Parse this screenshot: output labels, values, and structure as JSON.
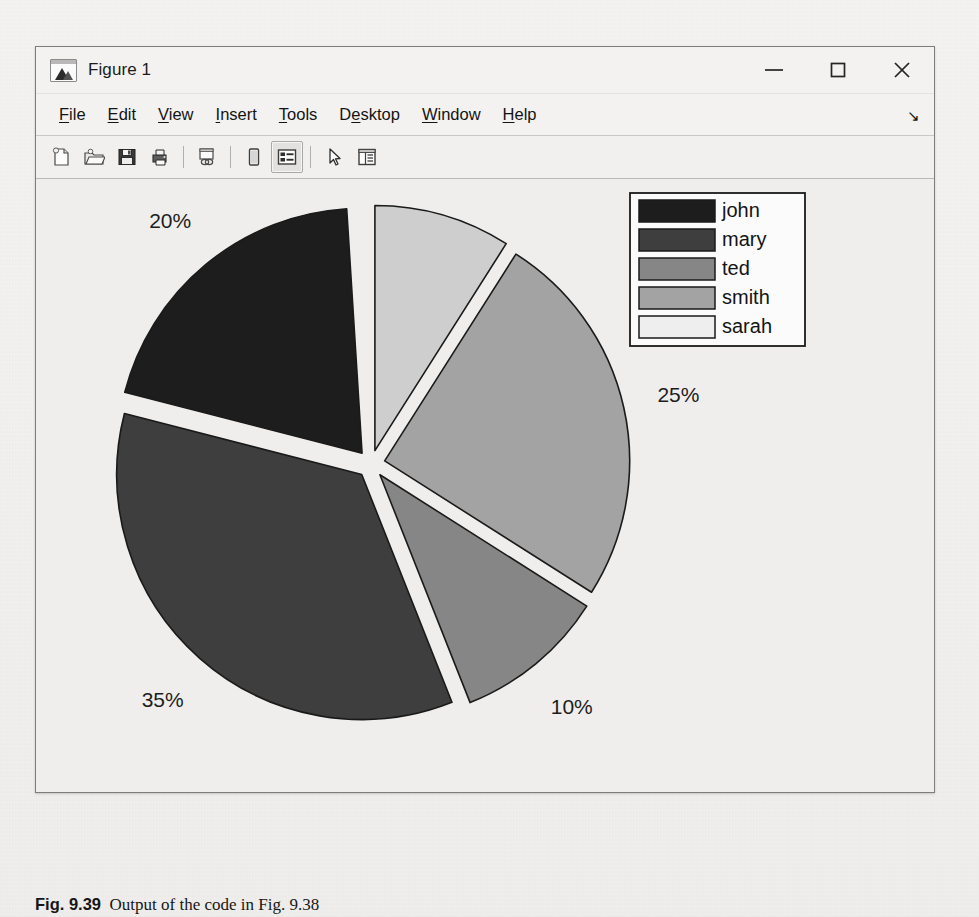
{
  "window": {
    "title": "Figure 1",
    "app_icon": "matlab-figure-icon",
    "controls": [
      {
        "name": "minimize",
        "glyph": "minimize-icon"
      },
      {
        "name": "maximize",
        "glyph": "maximize-icon"
      },
      {
        "name": "close",
        "glyph": "close-icon"
      }
    ]
  },
  "menu": {
    "items": [
      {
        "label": "File",
        "accel": "F"
      },
      {
        "label": "Edit",
        "accel": "E"
      },
      {
        "label": "View",
        "accel": "V"
      },
      {
        "label": "Insert",
        "accel": "I"
      },
      {
        "label": "Tools",
        "accel": "T"
      },
      {
        "label": "Desktop",
        "accel": "D"
      },
      {
        "label": "Window",
        "accel": "W"
      },
      {
        "label": "Help",
        "accel": "H"
      }
    ],
    "overflow_glyph": "↘"
  },
  "toolbar": {
    "buttons": [
      {
        "name": "new-figure-icon",
        "tooltip": "New Figure",
        "active": false
      },
      {
        "name": "open-file-icon",
        "tooltip": "Open File",
        "active": false
      },
      {
        "name": "save-figure-icon",
        "tooltip": "Save Figure",
        "active": false
      },
      {
        "name": "print-figure-icon",
        "tooltip": "Print Figure",
        "active": false
      },
      {
        "name": "separator",
        "tooltip": "",
        "active": false
      },
      {
        "name": "link-plot-icon",
        "tooltip": "Link Plot",
        "active": false
      },
      {
        "name": "separator",
        "tooltip": "",
        "active": false
      },
      {
        "name": "colorbar-icon",
        "tooltip": "Insert Colorbar",
        "active": false
      },
      {
        "name": "legend-icon",
        "tooltip": "Insert Legend",
        "active": true
      },
      {
        "name": "separator",
        "tooltip": "",
        "active": false
      },
      {
        "name": "pointer-arrow-icon",
        "tooltip": "Edit Plot",
        "active": false
      },
      {
        "name": "property-inspector-icon",
        "tooltip": "Property Inspector",
        "active": false
      }
    ]
  },
  "caption": {
    "figure_number": "Fig. 9.39",
    "text": "Output of the code in Fig. 9.38"
  },
  "chart_data": {
    "type": "pie",
    "title": "",
    "exploded": true,
    "start_angle_deg": 0,
    "direction": "clockwise",
    "legend_position": "top-right-inside",
    "grid": false,
    "labels": [
      "john",
      "mary",
      "ted",
      "smith",
      "sarah"
    ],
    "slice_colors": [
      "#1d1d1d",
      "#3e3e3e",
      "#868686",
      "#a3a3a3",
      "#cecece"
    ],
    "edge_color": "#1a1a1a",
    "background": "#efeeec",
    "categories": [
      "sarah",
      "smith",
      "ted",
      "mary",
      "john"
    ],
    "values": [
      9,
      25,
      10,
      35,
      20
    ],
    "value_labels": [
      "9%",
      "25%",
      "10%",
      "35%",
      "20%"
    ],
    "slices": [
      {
        "name": "sarah",
        "percent": 9,
        "label": "9%",
        "color": "#cecece",
        "start_deg": 0,
        "sweep_deg": 32.4
      },
      {
        "name": "smith",
        "percent": 25,
        "label": "25%",
        "color": "#a3a3a3",
        "start_deg": 32.4,
        "sweep_deg": 90.0
      },
      {
        "name": "ted",
        "percent": 10,
        "label": "10%",
        "color": "#868686",
        "start_deg": 122.4,
        "sweep_deg": 36.0
      },
      {
        "name": "mary",
        "percent": 35,
        "label": "35%",
        "color": "#3e3e3e",
        "start_deg": 158.4,
        "sweep_deg": 126.0
      },
      {
        "name": "john",
        "percent": 20,
        "label": "20%",
        "color": "#1d1d1d",
        "start_deg": 284.4,
        "sweep_deg": 72.0
      }
    ],
    "legend": {
      "entries": [
        {
          "label": "john",
          "color": "#1d1d1d"
        },
        {
          "label": "mary",
          "color": "#3e3e3e"
        },
        {
          "label": "ted",
          "color": "#868686"
        },
        {
          "label": "smith",
          "color": "#a3a3a3"
        },
        {
          "label": "sarah",
          "color": "#eeeeee"
        }
      ],
      "box_fill": "#fbfbfb",
      "box_edge": "#1a1a1a"
    }
  }
}
